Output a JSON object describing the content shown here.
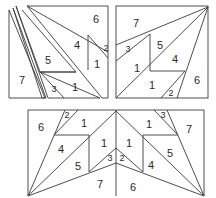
{
  "diagram": {
    "title": "",
    "panels": [
      {
        "id": "top-left",
        "description": "exploded tangram-like square with separated slivers",
        "labels": [
          {
            "text": "6",
            "x": 96,
            "y": 19
          },
          {
            "text": "4",
            "x": 77,
            "y": 45
          },
          {
            "text": "2",
            "x": 106,
            "y": 48,
            "small": true
          },
          {
            "text": "1",
            "x": 97,
            "y": 64
          },
          {
            "text": "5",
            "x": 48,
            "y": 60
          },
          {
            "text": "7",
            "x": 22,
            "y": 80
          },
          {
            "text": "1",
            "x": 75,
            "y": 87
          },
          {
            "text": "3",
            "x": 54,
            "y": 89,
            "small": true
          }
        ]
      },
      {
        "id": "top-right",
        "description": "assembled square with diagonal fan from top-right corner",
        "labels": [
          {
            "text": "7",
            "x": 136,
            "y": 23
          },
          {
            "text": "3",
            "x": 128,
            "y": 49,
            "small": true
          },
          {
            "text": "5",
            "x": 160,
            "y": 45
          },
          {
            "text": "4",
            "x": 175,
            "y": 59
          },
          {
            "text": "1",
            "x": 137,
            "y": 68
          },
          {
            "text": "6",
            "x": 197,
            "y": 80
          },
          {
            "text": "1",
            "x": 152,
            "y": 85
          },
          {
            "text": "2",
            "x": 171,
            "y": 93,
            "small": true
          }
        ]
      },
      {
        "id": "bottom",
        "description": "mirrored pair of squares joined at vertical centerline",
        "labels": [
          {
            "text": "6",
            "x": 41,
            "y": 127
          },
          {
            "text": "2",
            "x": 67,
            "y": 115,
            "small": true
          },
          {
            "text": "1",
            "x": 84,
            "y": 123
          },
          {
            "text": "4",
            "x": 61,
            "y": 149
          },
          {
            "text": "5",
            "x": 78,
            "y": 166
          },
          {
            "text": "1",
            "x": 104,
            "y": 143
          },
          {
            "text": "3",
            "x": 110,
            "y": 158,
            "small": true
          },
          {
            "text": "7",
            "x": 100,
            "y": 184
          },
          {
            "text": "1",
            "x": 129,
            "y": 143
          },
          {
            "text": "2",
            "x": 122,
            "y": 158,
            "small": true
          },
          {
            "text": "6",
            "x": 133,
            "y": 187
          },
          {
            "text": "1",
            "x": 149,
            "y": 124
          },
          {
            "text": "3",
            "x": 163,
            "y": 115,
            "small": true
          },
          {
            "text": "7",
            "x": 189,
            "y": 129
          },
          {
            "text": "5",
            "x": 170,
            "y": 153
          },
          {
            "text": "4",
            "x": 151,
            "y": 165
          }
        ]
      }
    ]
  }
}
